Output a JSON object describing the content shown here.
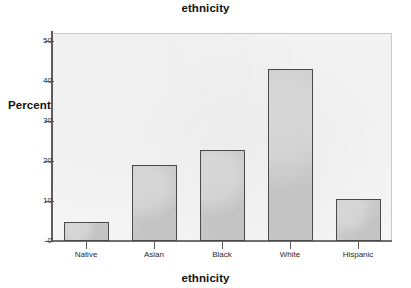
{
  "chart_data": {
    "type": "bar",
    "title": "ethnicity",
    "xlabel": "ethnicity",
    "ylabel": "Percent",
    "categories": [
      "Native",
      "Asian",
      "Black",
      "White",
      "Hispanic"
    ],
    "values": [
      4.8,
      19.0,
      22.8,
      43.0,
      10.5
    ],
    "ylim": [
      0,
      52
    ],
    "yticks": [
      0,
      10,
      20,
      30,
      40,
      50
    ],
    "ytick_labels": [
      "0",
      "10",
      "20",
      "30",
      "40",
      "50"
    ],
    "grid": false,
    "legend": null,
    "bar_fill_color": "#c9c9c9",
    "bar_border_color": "#4a4a4a",
    "plot_background_color": "#f6f6f6"
  }
}
